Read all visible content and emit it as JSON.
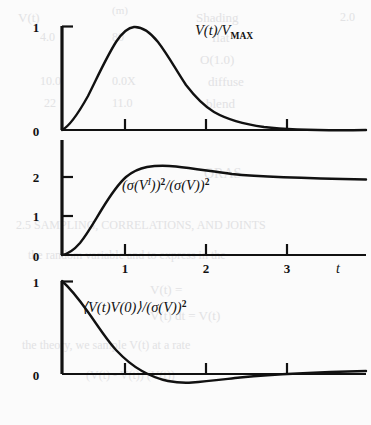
{
  "figure": {
    "background_color": "#fbfbfb",
    "ink_color": "#111111",
    "panels": [
      {
        "id": "panel-velocity",
        "label_parts": {
          "main": "V(t)/V",
          "sub": "MAX"
        },
        "label_plain": "V(t)/V_MAX",
        "y_ticks": [
          "0",
          "1"
        ],
        "x_ticks": [
          "",
          "",
          ""
        ],
        "x_axis_label": ""
      },
      {
        "id": "panel-variance-ratio",
        "label_parts": {
          "p1": "(σ(V",
          "sup_i": "I",
          "p2": "))",
          "sup_2a": "2",
          "p3": "/(σ(V))",
          "sup_2b": "2"
        },
        "label_plain": "(σ(V^I))^2/(σ(V))^2",
        "y_ticks": [
          "0",
          "1",
          "2"
        ],
        "x_ticks": [
          "1",
          "2",
          "3"
        ],
        "x_axis_label": "t"
      },
      {
        "id": "panel-autocorrelation",
        "label_parts": {
          "p1": "⟨V(t)V(0)⟩/(σ(V))",
          "sup_2": "2"
        },
        "label_plain": "⟨V(t)V(0)⟩/(σ(V))^2",
        "y_ticks": [
          "0",
          "1"
        ],
        "x_ticks": [
          "",
          "",
          ""
        ],
        "x_axis_label": ""
      }
    ],
    "bleed_through": [
      {
        "text": "V(t)",
        "x": 18,
        "y": 10,
        "size": 13
      },
      {
        "text": "(m)",
        "x": 112,
        "y": 4,
        "size": 11
      },
      {
        "text": "Shading",
        "x": 196,
        "y": 10,
        "size": 13
      },
      {
        "text": "2.0",
        "x": 340,
        "y": 10,
        "size": 12
      },
      {
        "text": "4.0",
        "x": 40,
        "y": 30,
        "size": 12
      },
      {
        "text": "80",
        "x": 112,
        "y": 30,
        "size": 12
      },
      {
        "text": "flat",
        "x": 212,
        "y": 30,
        "size": 13
      },
      {
        "text": "O(1.0)",
        "x": 200,
        "y": 52,
        "size": 13
      },
      {
        "text": "10.0",
        "x": 40,
        "y": 74,
        "size": 12
      },
      {
        "text": "0.0X",
        "x": 112,
        "y": 74,
        "size": 12
      },
      {
        "text": "diffuse",
        "x": 208,
        "y": 74,
        "size": 13
      },
      {
        "text": "22",
        "x": 44,
        "y": 96,
        "size": 12
      },
      {
        "text": "11.0",
        "x": 112,
        "y": 96,
        "size": 12
      },
      {
        "text": "blend",
        "x": 206,
        "y": 96,
        "size": 13
      },
      {
        "text": "ORAS",
        "x": 204,
        "y": 166,
        "size": 14
      },
      {
        "text": "2.5 SAMPLING, CORRELATIONS, AND JOINTS",
        "x": 16,
        "y": 218,
        "size": 12
      },
      {
        "text": "the random variable and to express in the",
        "x": 28,
        "y": 248,
        "size": 12
      },
      {
        "text": "V(t) =",
        "x": 150,
        "y": 282,
        "size": 13
      },
      {
        "text": "V(t) dt  =  V(t)",
        "x": 150,
        "y": 308,
        "size": 13
      },
      {
        "text": "the theory, we sample V(t) at a rate",
        "x": 22,
        "y": 338,
        "size": 12
      },
      {
        "text": "(V(t) - V(t)) (V(t))",
        "x": 86,
        "y": 368,
        "size": 12
      }
    ]
  },
  "chart_data": [
    {
      "type": "line",
      "title": "V(t)/V_MAX",
      "xlabel": "t",
      "ylabel": "V(t)/V_MAX",
      "xlim": [
        0,
        3.6
      ],
      "ylim": [
        0,
        1.12
      ],
      "y_tick_values": [
        0,
        1
      ],
      "x_tick_values": [
        1,
        2,
        3
      ],
      "grid": false,
      "annotation": "Normalized velocity response: rises from 0, peaks at 1.0 near t=1, decays toward 0.",
      "x": [
        0,
        0.1,
        0.2,
        0.3,
        0.4,
        0.5,
        0.6,
        0.7,
        0.8,
        0.9,
        1.0,
        1.1,
        1.2,
        1.4,
        1.6,
        1.8,
        2.0,
        2.2,
        2.4,
        2.6,
        2.8,
        3.0,
        3.2,
        3.4,
        3.6
      ],
      "y": [
        0,
        0.13,
        0.3,
        0.47,
        0.63,
        0.77,
        0.88,
        0.96,
        0.99,
        1.0,
        0.99,
        0.96,
        0.93,
        0.84,
        0.73,
        0.62,
        0.51,
        0.42,
        0.33,
        0.26,
        0.2,
        0.15,
        0.11,
        0.08,
        0.06
      ]
    },
    {
      "type": "line",
      "title": "(sigma(V^I))^2/(sigma(V))^2",
      "xlabel": "t",
      "ylabel": "(sigma(V^I))^2/(sigma(V))^2",
      "xlim": [
        0,
        3.6
      ],
      "ylim": [
        0,
        2.75
      ],
      "y_tick_values": [
        0,
        1,
        2
      ],
      "x_tick_values": [
        1,
        2,
        3
      ],
      "grid": false,
      "annotation": "Variance ratio: sigmoidal rise from 0, overshoot to ~2.5 near t=1.2, slow decay toward 2.",
      "x": [
        0,
        0.1,
        0.2,
        0.3,
        0.4,
        0.5,
        0.6,
        0.7,
        0.8,
        0.9,
        1.0,
        1.2,
        1.4,
        1.6,
        1.8,
        2.0,
        2.2,
        2.4,
        2.6,
        2.8,
        3.0,
        3.2,
        3.4,
        3.6
      ],
      "y": [
        0,
        0.1,
        0.3,
        0.6,
        0.95,
        1.33,
        1.7,
        2.0,
        2.24,
        2.39,
        2.47,
        2.51,
        2.49,
        2.45,
        2.4,
        2.34,
        2.29,
        2.24,
        2.19,
        2.15,
        2.12,
        2.09,
        2.07,
        2.05
      ]
    },
    {
      "type": "line",
      "title": "<V(t)V(0)>/(sigma(V))^2",
      "xlabel": "t",
      "ylabel": "<V(t)V(0)>/(sigma(V))^2",
      "xlim": [
        0,
        3.6
      ],
      "ylim": [
        -0.32,
        1.1
      ],
      "y_tick_values": [
        0,
        1
      ],
      "x_tick_values": [
        1,
        2,
        3
      ],
      "grid": false,
      "annotation": "Velocity autocorrelation: starts at 1, crosses zero near t=0.85, minimum about -0.13 near t=1.5, recovers toward 0.",
      "x": [
        0,
        0.1,
        0.2,
        0.3,
        0.4,
        0.5,
        0.6,
        0.7,
        0.8,
        0.9,
        1.0,
        1.1,
        1.2,
        1.4,
        1.6,
        1.8,
        2.0,
        2.2,
        2.4,
        2.6,
        2.8,
        3.0,
        3.2,
        3.4,
        3.6
      ],
      "y": [
        1.0,
        0.9,
        0.78,
        0.65,
        0.52,
        0.39,
        0.27,
        0.16,
        0.06,
        -0.02,
        -0.07,
        -0.11,
        -0.13,
        -0.145,
        -0.14,
        -0.13,
        -0.12,
        -0.11,
        -0.095,
        -0.085,
        -0.075,
        -0.065,
        -0.055,
        -0.05,
        -0.045
      ]
    }
  ]
}
